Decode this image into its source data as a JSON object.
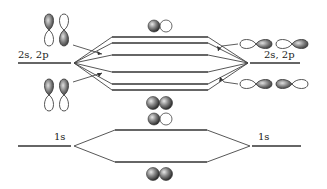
{
  "diagram": {
    "type": "molecular-orbital-energy-diagram",
    "left_atom": {
      "valence_label": "2s, 2p",
      "core_label": "1s"
    },
    "right_atom": {
      "valence_label": "2s, 2p",
      "core_label": "1s"
    },
    "valence_mo_levels_count": 6,
    "core_mo_levels_count": 2,
    "mo_symbols": [
      {
        "position": "top",
        "description": "one shaded sphere + one empty sphere (antibonding s)"
      },
      {
        "position": "middle-upper",
        "description": "two shaded spheres (bonding s)"
      },
      {
        "position": "middle-lower",
        "description": "one shaded sphere + one empty sphere (antibonding 1s)"
      },
      {
        "position": "bottom",
        "description": "two shaded spheres (bonding 1s)"
      }
    ],
    "left_orbitals": "vertical p-orbital lobes",
    "right_orbitals": "horizontal p-orbital lobes"
  }
}
